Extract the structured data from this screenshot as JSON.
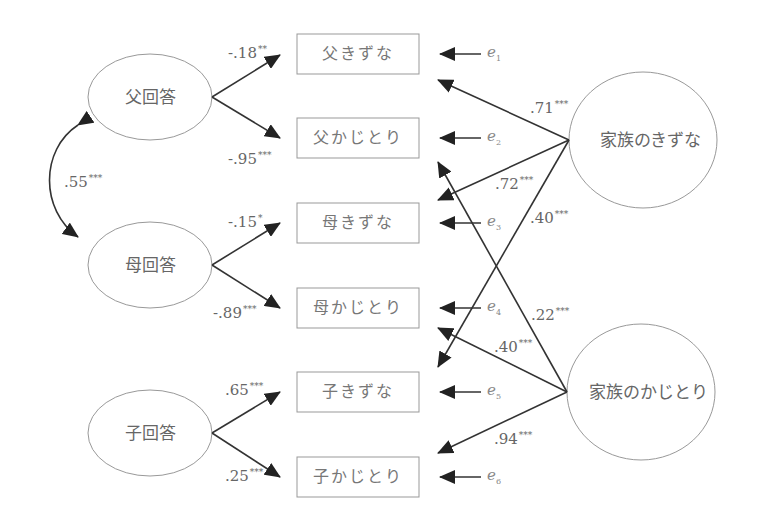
{
  "latents": {
    "father_response": {
      "label": "父回答",
      "cx": 150,
      "cy": 97,
      "rx": 62,
      "ry": 43
    },
    "mother_response": {
      "label": "母回答",
      "cx": 150,
      "cy": 265,
      "rx": 62,
      "ry": 43
    },
    "child_response": {
      "label": "子回答",
      "cx": 150,
      "cy": 433,
      "rx": 62,
      "ry": 43
    },
    "family_cohesion": {
      "label": "家族のきずな",
      "cx": 643,
      "cy": 140,
      "rx": 74,
      "ry": 68
    },
    "family_adaptability": {
      "label": "家族のかじとり",
      "cx": 641,
      "cy": 392,
      "rx": 74,
      "ry": 68
    }
  },
  "observed": [
    {
      "id": "father_cohesion",
      "label": "父きずな",
      "y": 34,
      "error": "e",
      "error_sub": "1"
    },
    {
      "id": "father_adaptability",
      "label": "父かじとり",
      "y": 118,
      "error": "e",
      "error_sub": "2"
    },
    {
      "id": "mother_cohesion",
      "label": "母きずな",
      "y": 203,
      "error": "e",
      "error_sub": "3"
    },
    {
      "id": "mother_adaptability",
      "label": "母かじとり",
      "y": 288,
      "error": "e",
      "error_sub": "4"
    },
    {
      "id": "child_cohesion",
      "label": "子きずな",
      "y": 372,
      "error": "e",
      "error_sub": "5"
    },
    {
      "id": "child_adaptability",
      "label": "子かじとり",
      "y": 457,
      "error": "e",
      "error_sub": "6"
    }
  ],
  "paths": {
    "father_to_cohesion": {
      "value": "-.18",
      "sig": "**"
    },
    "father_to_adaptability": {
      "value": "-.95",
      "sig": "***"
    },
    "mother_to_cohesion": {
      "value": "-.15",
      "sig": "*"
    },
    "mother_to_adaptability": {
      "value": "-.89",
      "sig": "***"
    },
    "child_to_cohesion": {
      "value": ".65",
      "sig": "***"
    },
    "child_to_adaptability": {
      "value": ".25",
      "sig": "***"
    },
    "cohesion_to_father": {
      "value": ".71",
      "sig": "***"
    },
    "cohesion_to_mother": {
      "value": ".72",
      "sig": "***"
    },
    "cohesion_to_child": {
      "value": ".40",
      "sig": "***"
    },
    "adaptability_to_father": {
      "value": ".22",
      "sig": "***"
    },
    "adaptability_to_mother": {
      "value": ".40",
      "sig": "***"
    },
    "adaptability_to_child": {
      "value": ".94",
      "sig": "***"
    },
    "father_mother_covariance": {
      "value": ".55",
      "sig": "***"
    }
  },
  "colors": {
    "line": "#333333",
    "shape_stroke": "#999999",
    "text": "#666666"
  }
}
